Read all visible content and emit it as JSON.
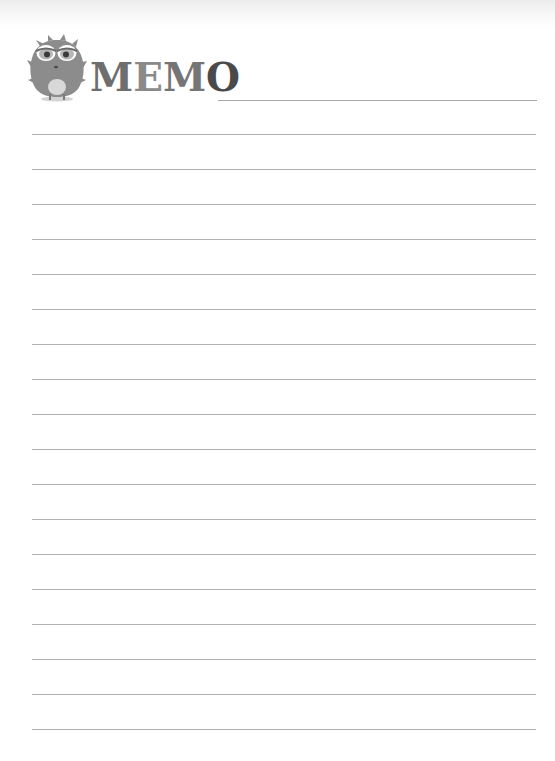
{
  "header": {
    "title": "MEMO",
    "title_letters": [
      "M",
      "E",
      "M",
      "O"
    ],
    "mascot_icon": "fuzzy-grey-monster-icon"
  },
  "page": {
    "ruled_line_count": 18,
    "line_spacing_px": 35,
    "line_color": "#b0b0b0",
    "background": "#ffffff"
  },
  "lines": [
    "",
    "",
    "",
    "",
    "",
    "",
    "",
    "",
    "",
    "",
    "",
    "",
    "",
    "",
    "",
    "",
    "",
    ""
  ]
}
